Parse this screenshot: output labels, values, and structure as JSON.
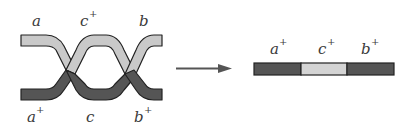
{
  "diagram": {
    "type": "genetic-recombination-double-crossover",
    "colors": {
      "light_strand": "#c9c9c9",
      "dark_strand": "#555555",
      "outline": "#222222",
      "arrow": "#555555",
      "text": "#3a3a3a"
    },
    "left": {
      "top_labels": [
        {
          "base": "a",
          "sup": ""
        },
        {
          "base": "c",
          "sup": "+"
        },
        {
          "base": "b",
          "sup": ""
        }
      ],
      "bottom_labels": [
        {
          "base": "a",
          "sup": "+"
        },
        {
          "base": "c",
          "sup": ""
        },
        {
          "base": "b",
          "sup": "+"
        }
      ]
    },
    "arrow": {
      "direction": "right"
    },
    "right": {
      "labels": [
        {
          "base": "a",
          "sup": "+"
        },
        {
          "base": "c",
          "sup": "+"
        },
        {
          "base": "b",
          "sup": "+"
        }
      ],
      "segments": [
        "dark",
        "light",
        "dark"
      ]
    }
  }
}
